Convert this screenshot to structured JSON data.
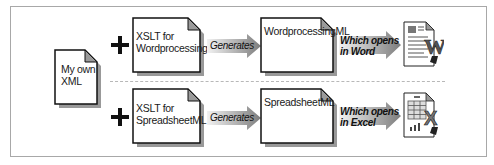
{
  "diagram": {
    "source_doc": {
      "label_line1": "My own",
      "label_line2": "XML"
    },
    "rows": [
      {
        "operator": "+",
        "xslt_doc": {
          "label_line1": "XSLT for",
          "label_line2": "WordprocessingML"
        },
        "generates_label": "Generates",
        "output_doc": {
          "label": "WordprocessingML"
        },
        "opens_label_line1": "Which opens",
        "opens_label_line2": "in Word",
        "app_icon": "word-document-icon",
        "app_letter": "W"
      },
      {
        "operator": "+",
        "xslt_doc": {
          "label_line1": "XSLT for",
          "label_line2": "SpreadsheetML"
        },
        "generates_label": "Generates",
        "output_doc": {
          "label": "SpreadsheetML"
        },
        "opens_label_line1": "Which opens",
        "opens_label_line2": "in Excel",
        "app_icon": "excel-spreadsheet-icon",
        "app_letter": "X"
      }
    ]
  },
  "colors": {
    "border": "#a8a8a8",
    "arrow_light": "#e6e6e6",
    "arrow_dark": "#8a8a8a",
    "doc_fold": "#9a9a9a",
    "shadow": "#555555"
  }
}
